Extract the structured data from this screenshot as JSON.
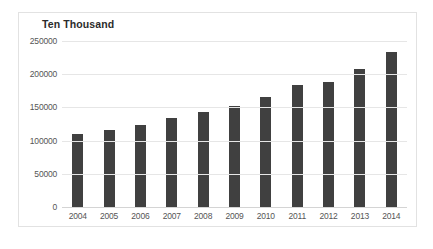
{
  "chart_data": {
    "type": "bar",
    "title": "Ten Thousand",
    "xlabel": "",
    "ylabel": "",
    "categories": [
      "2004",
      "2005",
      "2006",
      "2007",
      "2008",
      "2009",
      "2010",
      "2011",
      "2012",
      "2013",
      "2014"
    ],
    "values": [
      112000,
      117000,
      125000,
      135000,
      145000,
      153000,
      167000,
      186000,
      190000,
      210000,
      235000
    ],
    "ylim": [
      0,
      250000
    ],
    "yticks": [
      0,
      50000,
      100000,
      150000,
      200000,
      250000
    ],
    "ytick_labels": [
      "0",
      "50000",
      "100000",
      "150000",
      "200000",
      "250000"
    ],
    "grid": true,
    "legend": false,
    "bar_color": "#404040",
    "gridline_color": "#e6e6e6",
    "border_color": "#e2e2e2",
    "background_color": "#ffffff"
  }
}
